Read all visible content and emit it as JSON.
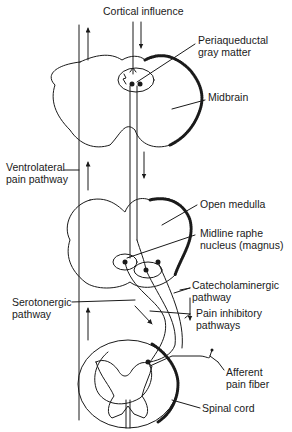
{
  "diagram": {
    "type": "neuroanatomy",
    "colors": {
      "line": "#1a1a1a",
      "background": "#ffffff",
      "hatch": "#555555"
    },
    "labels": {
      "cortical_influence": "Cortical influence",
      "periaqueductal_1": "Periaqueductal",
      "periaqueductal_2": "gray matter",
      "midbrain": "Midbrain",
      "ventrolateral_1": "Ventrolateral",
      "ventrolateral_2": "pain pathway",
      "open_medulla": "Open medulla",
      "raphe_1": "Midline raphe",
      "raphe_2": "nucleus (magnus)",
      "catecholaminergic_1": "Catecholaminergic",
      "catecholaminergic_2": "pathway",
      "serotonergic_1": "Serotonergic",
      "serotonergic_2": "pathway",
      "pain_inhibitory_1": "Pain inhibitory",
      "pain_inhibitory_2": "pathways",
      "afferent_1": "Afferent",
      "afferent_2": "pain fiber",
      "spinal_cord": "Spinal cord"
    },
    "sections": [
      "Midbrain",
      "Open medulla",
      "Spinal cord"
    ]
  }
}
